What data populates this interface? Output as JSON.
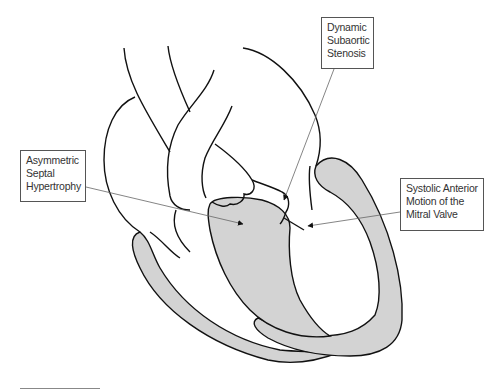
{
  "diagram": {
    "colors": {
      "outline": "#111111",
      "myocardium_fill": "#d3d3d3",
      "leader_line": "#555555",
      "background": "#ffffff"
    },
    "labels": [
      {
        "id": "dynamic-subaortic-stenosis",
        "lines": [
          "Dynamic",
          "Subaortic",
          "Stenosis"
        ]
      },
      {
        "id": "asymmetric-septal-hypertrophy",
        "lines": [
          "Asymmetric",
          "Septal",
          "Hypertrophy"
        ]
      },
      {
        "id": "systolic-anterior-motion",
        "lines": [
          "Systolic Anterior",
          "Motion of the",
          "Mitral Valve"
        ]
      }
    ]
  }
}
